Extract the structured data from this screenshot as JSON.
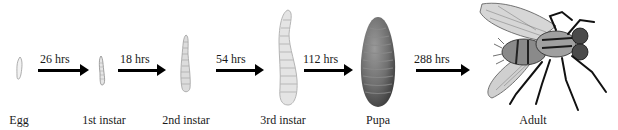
{
  "diagram": {
    "type": "life-cycle",
    "stages": [
      {
        "id": "egg",
        "label": "Egg"
      },
      {
        "id": "instar1",
        "label": "1st instar"
      },
      {
        "id": "instar2",
        "label": "2nd instar"
      },
      {
        "id": "instar3",
        "label": "3rd instar"
      },
      {
        "id": "pupa",
        "label": "Pupa"
      },
      {
        "id": "adult",
        "label": "Adult"
      }
    ],
    "transitions": [
      {
        "from": "egg",
        "to": "instar1",
        "label": "26 hrs"
      },
      {
        "from": "instar1",
        "to": "instar2",
        "label": "18 hrs"
      },
      {
        "from": "instar2",
        "to": "instar3",
        "label": "54 hrs"
      },
      {
        "from": "instar3",
        "to": "pupa",
        "label": "112 hrs"
      },
      {
        "from": "pupa",
        "to": "adult",
        "label": "288 hrs"
      }
    ],
    "colors": {
      "arrow": "#000000",
      "pupa": "#6e6e6e",
      "larva": "#d8d8d8",
      "text": "#1a1a1a"
    }
  }
}
